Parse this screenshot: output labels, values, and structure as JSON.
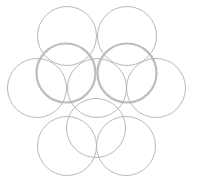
{
  "diagram": {
    "stroke_color": "#b8b8b8",
    "emphasis_stroke_color": "#bdbdbd",
    "circles": [
      {
        "id": "top-left",
        "emphasis": false
      },
      {
        "id": "top-right",
        "emphasis": false
      },
      {
        "id": "upper-left-thick",
        "emphasis": true
      },
      {
        "id": "upper-right-thick",
        "emphasis": true
      },
      {
        "id": "middle-left",
        "emphasis": false
      },
      {
        "id": "middle-center",
        "emphasis": false
      },
      {
        "id": "middle-right",
        "emphasis": false
      },
      {
        "id": "lower-center",
        "emphasis": false
      },
      {
        "id": "bottom-left",
        "emphasis": false
      },
      {
        "id": "bottom-right",
        "emphasis": false
      }
    ]
  }
}
